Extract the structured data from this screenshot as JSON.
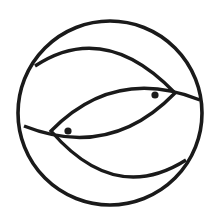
{
  "symbol": {
    "name": "Two fish (ichthys) in a circle",
    "stroke_color": "#1a1a1a",
    "background_color": "#ffffff",
    "outer_circle": {
      "cx": 110,
      "cy": 113,
      "r": 92,
      "stroke_width": 3.6
    },
    "fish": [
      {
        "id": "upper-fish",
        "facing": "right",
        "body_path": "M 35 66 Q 105 20 175 93 Q 110 160 24 126",
        "eye": {
          "cx": 155,
          "cy": 95,
          "r": 3.6
        }
      },
      {
        "id": "lower-fish",
        "facing": "left",
        "body_path": "M 200 100 Q 115 66 51 131 Q 115 205 186 160",
        "eye": {
          "cx": 68,
          "cy": 131,
          "r": 3.6
        }
      }
    ],
    "line_width": 3.4
  }
}
